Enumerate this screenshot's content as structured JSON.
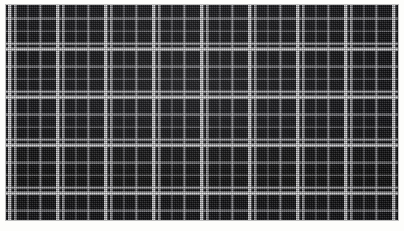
{
  "image": {
    "kind": "fabric-swatch-photograph",
    "subject": "black and white windowpane check woven fabric",
    "width_px": 404,
    "height_px": 231,
    "caption": "Black and white windowpane check fabric swatch",
    "alt_text": "Close-up photograph of a dark near-black woven cloth overlaid with a regular grid of white and pale grey checked lines"
  },
  "plate": {
    "left_px": 6,
    "top_px": 5,
    "width_px": 392,
    "height_px": 215,
    "border_label": "white paper margin"
  },
  "palette": {
    "background": "#fdfdfb",
    "ground_dark": "#0b0b0e",
    "ground_dark_alt": "#101014",
    "line_bright": "#f8f8fa",
    "line_mid": "#e4e4e8",
    "line_faint": "#b0b0b6",
    "plate_edge": "#bebebe"
  },
  "pattern": {
    "name": "windowpane check",
    "repeat_px": 48,
    "weave": "twill",
    "vertical_bars": [
      {
        "offset_px": 2,
        "width_px": 4,
        "tone": "bright"
      },
      {
        "offset_px": 8,
        "width_px": 3,
        "tone": "mid"
      },
      {
        "offset_px": 21,
        "width_px": 2,
        "tone": "faint"
      },
      {
        "offset_px": 33,
        "width_px": 3,
        "tone": "mid"
      }
    ],
    "horizontal_bars": [
      {
        "offset_px": 2,
        "width_px": 4,
        "tone": "bright"
      },
      {
        "offset_px": 8,
        "width_px": 3,
        "tone": "mid"
      },
      {
        "offset_px": 21,
        "width_px": 2,
        "tone": "faint"
      },
      {
        "offset_px": 33,
        "width_px": 3,
        "tone": "mid"
      }
    ],
    "columns_visible": 8,
    "rows_visible": 5
  }
}
